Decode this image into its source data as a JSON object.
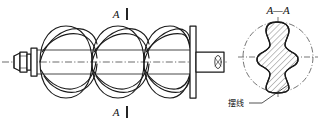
{
  "drawing": {
    "title": "Cycloidal screw rotor engineering drawing",
    "background_color": "#ffffff",
    "line_color": "#1a1a1a",
    "labels": {
      "section_mark_top": "A",
      "section_mark_bottom": "A",
      "section_view_title": "A—A",
      "callout_text": "摆线"
    },
    "views": {
      "main_view": {
        "name": "screw-rotor-elevation",
        "description": "Helical screw rotor shown in elevation with left stepped shaft end and right cylindrical shaft end",
        "flight_count": 3
      },
      "section_view": {
        "name": "section-a-a",
        "description": "Circular section A—A showing hatched lobed rotor profile",
        "hatch_angle_deg": 45,
        "circle_center": [
          278,
          57
        ],
        "circle_radius": 35
      }
    },
    "callout": {
      "text": "摆线",
      "leader_from": [
        249,
        101
      ],
      "leader_to": [
        287,
        85
      ]
    }
  }
}
